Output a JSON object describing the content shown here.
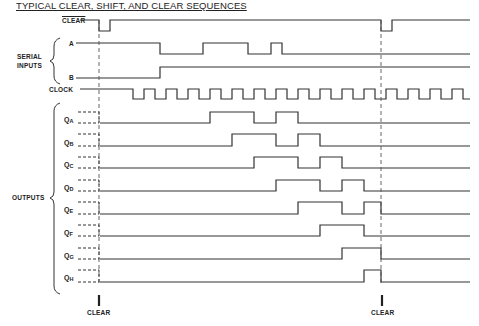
{
  "title": "TYPICAL CLEAR, SHIFT, AND CLEAR SEQUENCES",
  "labels": {
    "clear_overbar": "CLEAR",
    "serial_inputs_line1": "SERIAL",
    "serial_inputs_line2": "INPUTS",
    "input_a": "A",
    "input_b": "B",
    "clock": "CLOCK",
    "outputs": "OUTPUTS",
    "clear_marker_1": "CLEAR",
    "clear_marker_2": "CLEAR"
  },
  "outputs": [
    {
      "name": "Q",
      "sub": "A"
    },
    {
      "name": "Q",
      "sub": "B"
    },
    {
      "name": "Q",
      "sub": "C"
    },
    {
      "name": "Q",
      "sub": "D"
    },
    {
      "name": "Q",
      "sub": "E"
    },
    {
      "name": "Q",
      "sub": "F"
    },
    {
      "name": "Q",
      "sub": "G"
    },
    {
      "name": "Q",
      "sub": "H"
    }
  ],
  "waveforms": {
    "x_start": 100,
    "x_end": 470,
    "clear": {
      "high_default": true,
      "low_pulses": [
        [
          99,
          110
        ],
        [
          381,
          392
        ]
      ]
    },
    "serial_a": {
      "high_default": true,
      "low_intervals": [
        [
          160,
          203
        ],
        [
          248,
          271
        ],
        [
          282,
          470
        ]
      ]
    },
    "serial_b": {
      "high_default": false,
      "high_intervals": [
        [
          160,
          470
        ]
      ]
    },
    "clock": {
      "period": 22,
      "first_fall": 133,
      "low_width": 11
    },
    "outputs_high_intervals": {
      "QA": [
        [
          210,
          254
        ],
        [
          276,
          298
        ]
      ],
      "QB": [
        [
          232,
          276
        ],
        [
          298,
          320
        ]
      ],
      "QC": [
        [
          254,
          298
        ],
        [
          320,
          342
        ]
      ],
      "QD": [
        [
          276,
          320
        ],
        [
          342,
          364
        ]
      ],
      "QE": [
        [
          298,
          342
        ],
        [
          364,
          381
        ]
      ],
      "QF": [
        [
          320,
          364
        ]
      ],
      "QG": [
        [
          342,
          381
        ]
      ],
      "QH": [
        [
          364,
          381
        ]
      ]
    },
    "clear_time_markers_x": [
      99,
      381
    ]
  }
}
